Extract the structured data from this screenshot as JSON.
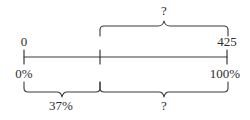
{
  "figure": {
    "type": "number-line-double-scale",
    "stroke_color": "#3a3a3a",
    "background_color": "#ffffff",
    "number_line": {
      "name": "number-line",
      "x_start": 24,
      "x_end": 227,
      "y": 57,
      "ticks": [
        {
          "name": "tick-left",
          "x": 24,
          "value_label": "0",
          "percent_label": "0%"
        },
        {
          "name": "tick-middle",
          "x": 100,
          "value_label": "",
          "percent_label": ""
        },
        {
          "name": "tick-right",
          "x": 227,
          "value_label": "425",
          "percent_label": "100%"
        }
      ]
    },
    "labels": {
      "value_left": "0",
      "value_right": "425",
      "percent_left": "0%",
      "percent_right": "100%",
      "top_brace_label": "?",
      "bottom_left_brace_label": "37%",
      "bottom_right_brace_label": "?"
    },
    "braces": [
      {
        "name": "top-brace",
        "position": "above",
        "x_left": 100,
        "x_right": 228,
        "label": "?",
        "spans": "from 37% mark to 100% (425)"
      },
      {
        "name": "bottom-brace-left",
        "position": "below",
        "x_left": 24,
        "x_right": 100,
        "label": "37%",
        "spans": "from 0% to the middle tick"
      },
      {
        "name": "bottom-brace-right",
        "position": "below",
        "x_left": 100,
        "x_right": 228,
        "label": "?",
        "spans": "from the middle tick to 100%"
      }
    ]
  }
}
